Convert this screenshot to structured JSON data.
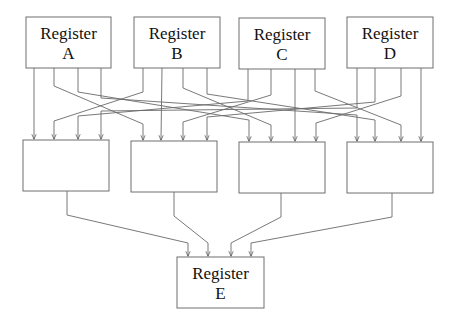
{
  "diagram": {
    "type": "register-interconnect",
    "top_registers": [
      {
        "id": "A",
        "line1": "Register",
        "line2": "A",
        "x": 26,
        "y": 17,
        "w": 85,
        "h": 51,
        "outputs": [
          34,
          54,
          78,
          101
        ]
      },
      {
        "id": "B",
        "line1": "Register",
        "line2": "B",
        "x": 134,
        "y": 17,
        "w": 86,
        "h": 51,
        "outputs": [
          143,
          162,
          183,
          207
        ]
      },
      {
        "id": "C",
        "line1": "Register",
        "line2": "C",
        "x": 239,
        "y": 18,
        "w": 86,
        "h": 51,
        "outputs": [
          248,
          271,
          295,
          315
        ]
      },
      {
        "id": "D",
        "line1": "Register",
        "line2": "D",
        "x": 347,
        "y": 17,
        "w": 86,
        "h": 51,
        "outputs": [
          357,
          375,
          401,
          421
        ]
      }
    ],
    "middle_units": [
      {
        "id": "M1",
        "x": 23,
        "y": 140,
        "w": 86,
        "h": 51,
        "inputs": [
          34,
          54,
          78,
          101
        ],
        "output": 67
      },
      {
        "id": "M2",
        "x": 131,
        "y": 141,
        "w": 86,
        "h": 51,
        "inputs": [
          143,
          161,
          183,
          207
        ],
        "output": 174
      },
      {
        "id": "M3",
        "x": 239,
        "y": 142,
        "w": 86,
        "h": 51,
        "inputs": [
          249,
          271,
          295,
          316
        ],
        "output": 281
      },
      {
        "id": "M4",
        "x": 347,
        "y": 142,
        "w": 86,
        "h": 51,
        "inputs": [
          357,
          375,
          401,
          421
        ],
        "output": 392
      }
    ],
    "bottom_register": {
      "id": "E",
      "line1": "Register",
      "line2": "E",
      "x": 177,
      "y": 257,
      "w": 87,
      "h": 51,
      "inputs": [
        188,
        208,
        231,
        251
      ]
    },
    "routing": "output i of top register j connects to input j of middle unit i; each middle unit feeds one input of Register E"
  }
}
